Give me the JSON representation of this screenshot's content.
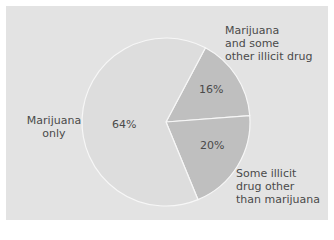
{
  "chart_data": {
    "type": "pie",
    "title": "",
    "slices": [
      {
        "label": "Marijuana only",
        "value": 64,
        "display": "64%",
        "color": "#dddddd"
      },
      {
        "label": "Marijuana and some other illicit drug",
        "value": 16,
        "display": "16%",
        "color": "#bfbfbf"
      },
      {
        "label": "Some illicit drug other than marijuana",
        "value": 20,
        "display": "20%",
        "color": "#bfbfbf"
      }
    ],
    "legend": "none (labels placed beside slices)"
  },
  "labels": {
    "only_l1": "Marijuana",
    "only_l2": "only",
    "other_l1": "Marijuana",
    "other_l2": "and some",
    "other_l3": "other illicit drug",
    "illicit_l1": "Some illicit",
    "illicit_l2": "drug other",
    "illicit_l3": "than marijuana",
    "pct_only": "64%",
    "pct_other": "16%",
    "pct_illicit": "20%"
  }
}
